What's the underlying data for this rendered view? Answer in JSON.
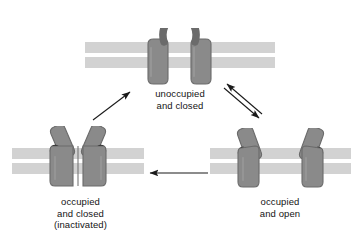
{
  "diagram": {
    "background_color": "#ffffff",
    "colors": {
      "protein_fill": "#8a8a8a",
      "protein_edge": "#6e6e6e",
      "protein_highlight": "#9e9e9e",
      "membrane_band": "#d2d2d2",
      "membrane_gap": "#ffffff",
      "ligand": "#0f0f0f",
      "arrow": "#1a1a1a",
      "text": "#141414"
    },
    "states": [
      {
        "id": "unoccupied-closed",
        "label_lines": [
          "unoccupied",
          "and closed"
        ],
        "position": "top-center",
        "gate": "closed",
        "ligands_bound": 0
      },
      {
        "id": "occupied-open",
        "label_lines": [
          "occupied",
          "and open"
        ],
        "position": "bottom-right",
        "gate": "open",
        "ligands_bound": 2
      },
      {
        "id": "occupied-closed-inactivated",
        "label_lines": [
          "occupied",
          "and closed",
          "(inactivated)"
        ],
        "position": "bottom-left",
        "gate": "closed",
        "ligands_bound": 2
      }
    ],
    "arrows": [
      {
        "id": "unoccupied-to-open",
        "from": "unoccupied-closed",
        "to": "occupied-open",
        "style": "double-reversible"
      },
      {
        "id": "open-to-inactivated",
        "from": "occupied-open",
        "to": "occupied-closed-inactivated",
        "style": "single",
        "direction": "left"
      },
      {
        "id": "inactivated-to-unoccupied",
        "from": "occupied-closed-inactivated",
        "to": "unoccupied-closed",
        "style": "single",
        "direction": "up-right"
      }
    ]
  }
}
